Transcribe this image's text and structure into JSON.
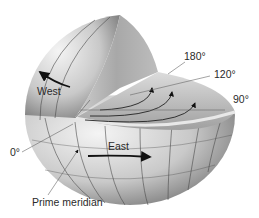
{
  "labels": {
    "west": "West",
    "east": "East",
    "deg_180": "180°",
    "deg_120": "120°",
    "deg_90": "90°",
    "deg_0": "0°",
    "prime_meridian": "Prime meridian"
  },
  "colors": {
    "sphere_light": "#f2f2f2",
    "sphere_dark": "#7a7a7a",
    "lines": "#3a3a3a",
    "arrow": "#111111",
    "leader": "#555555"
  }
}
